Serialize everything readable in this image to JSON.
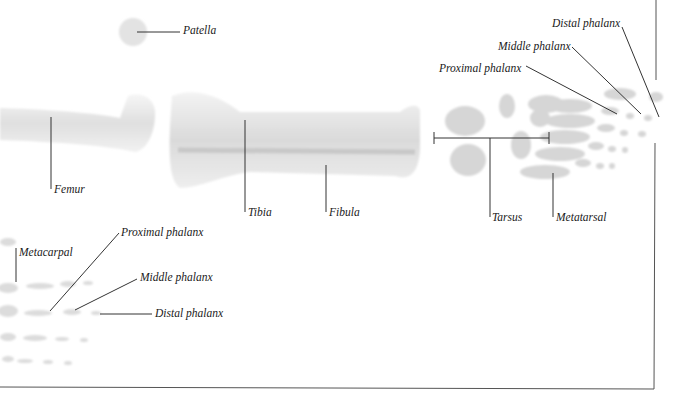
{
  "diagram": {
    "labels": {
      "patella": "Patella",
      "femur": "Femur",
      "tibia": "Tibia",
      "fibula": "Fibula",
      "tarsus": "Tarsus",
      "metatarsal": "Metatarsal",
      "foot_proximal_phalanx": "Proximal phalanx",
      "foot_middle_phalanx": "Middle phalanx",
      "foot_distal_phalanx": "Distal phalanx",
      "metacarpal": "Metacarpal",
      "hand_proximal_phalanx": "Proximal phalanx",
      "hand_middle_phalanx": "Middle phalanx",
      "hand_distal_phalanx": "Distal phalanx"
    },
    "colors": {
      "background": "#ffffff",
      "bone": "#d9d9d9",
      "bone_shadow": "#bdbdbd",
      "leader_line": "#333333",
      "label_text": "#1a1a1a"
    }
  }
}
